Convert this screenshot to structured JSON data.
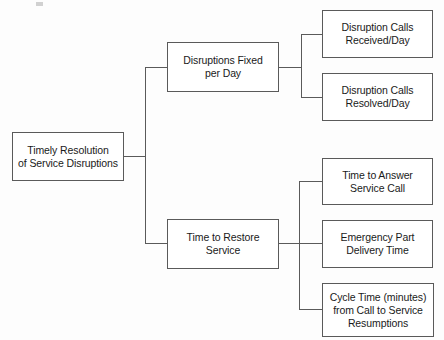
{
  "diagram": {
    "orientation": "left-to-right",
    "line_color": "#5a5a5a",
    "box_border_color": "#5a5a5a",
    "box_fill": "#ffffff",
    "text_color": "#1a1a1a",
    "background": "#fdfdfd",
    "levels": 3,
    "nodes": [
      {
        "id": "root",
        "level": 0,
        "label": "Timely Resolution\nof Service Disruptions",
        "x": 12,
        "y": 132,
        "w": 112,
        "h": 49
      },
      {
        "id": "branch-1",
        "level": 1,
        "label": "Disruptions Fixed\nper Day",
        "x": 167,
        "y": 42,
        "w": 112,
        "h": 50
      },
      {
        "id": "branch-2",
        "level": 1,
        "label": "Time to Restore\nService",
        "x": 167,
        "y": 219,
        "w": 112,
        "h": 50
      },
      {
        "id": "leaf-1",
        "level": 2,
        "label": "Disruption Calls\nReceived/Day",
        "x": 322,
        "y": 10,
        "w": 111,
        "h": 48
      },
      {
        "id": "leaf-2",
        "level": 2,
        "label": "Disruption Calls\nResolved/Day",
        "x": 322,
        "y": 73,
        "w": 111,
        "h": 48
      },
      {
        "id": "leaf-3",
        "level": 2,
        "label": "Time to Answer\nService Call",
        "x": 322,
        "y": 158,
        "w": 111,
        "h": 47
      },
      {
        "id": "leaf-4",
        "level": 2,
        "label": "Emergency Part\nDelivery Time",
        "x": 322,
        "y": 220,
        "w": 111,
        "h": 48
      },
      {
        "id": "leaf-5",
        "level": 2,
        "label": "Cycle Time (minutes)\nfrom Call to Service\nResumptions",
        "x": 322,
        "y": 283,
        "w": 112,
        "h": 54
      }
    ],
    "connectors": [
      {
        "id": "root-to-trunk",
        "from": "root",
        "to": "trunk-main",
        "points": "124,156 145,156"
      },
      {
        "id": "trunk-main",
        "from": "trunk-main",
        "to": "branch-1",
        "points": "145,67 145,243"
      },
      {
        "id": "trunk-to-branch-1",
        "from": "trunk-main",
        "to": "branch-1",
        "points": "145,67 167,67"
      },
      {
        "id": "trunk-to-branch-2",
        "from": "trunk-main",
        "to": "branch-2",
        "points": "145,243 167,243"
      },
      {
        "id": "branch-1-stub",
        "from": "branch-1",
        "to": "trunk-top",
        "points": "279,67 301,67"
      },
      {
        "id": "trunk-top",
        "from": "trunk-top",
        "to": "leaf-1",
        "points": "301,34 301,98"
      },
      {
        "id": "trunk-top-to-leaf-1",
        "from": "trunk-top",
        "to": "leaf-1",
        "points": "301,34 322,34"
      },
      {
        "id": "trunk-top-to-leaf-2",
        "from": "trunk-top",
        "to": "leaf-2",
        "points": "301,98 322,98"
      },
      {
        "id": "branch-2-stub",
        "from": "branch-2",
        "to": "trunk-bottom",
        "points": "279,243 299,243"
      },
      {
        "id": "trunk-bottom",
        "from": "trunk-bottom",
        "to": "leaf-3",
        "points": "299,181 299,310"
      },
      {
        "id": "trunk-bottom-to-leaf-3",
        "from": "trunk-bottom",
        "to": "leaf-3",
        "points": "299,181 322,181"
      },
      {
        "id": "trunk-bottom-to-leaf-4",
        "from": "trunk-bottom",
        "to": "leaf-4",
        "points": "299,243 322,243"
      },
      {
        "id": "trunk-bottom-to-leaf-5",
        "from": "trunk-bottom",
        "to": "leaf-5",
        "points": "299,310 322,310"
      }
    ]
  }
}
